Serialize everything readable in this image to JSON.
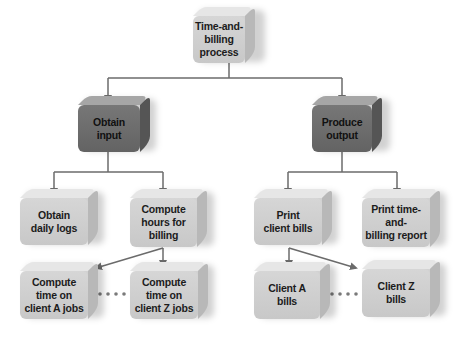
{
  "diagram": {
    "type": "hierarchy chart",
    "root": {
      "label": "Time-and-\nbilling\nprocess"
    },
    "level1": [
      {
        "label": "Obtain\ninput",
        "style": "dark"
      },
      {
        "label": "Produce\noutput",
        "style": "dark"
      }
    ],
    "level2": [
      {
        "label": "Obtain\ndaily logs",
        "parent": "Obtain input"
      },
      {
        "label": "Compute\nhours for\nbilling",
        "parent": "Obtain input"
      },
      {
        "label": "Print\nclient bills",
        "parent": "Produce output"
      },
      {
        "label": "Print time-\nand-\nbilling report",
        "parent": "Produce output"
      }
    ],
    "level3": [
      {
        "label": "Compute\ntime on\nclient A jobs",
        "parent": "Compute hours for billing"
      },
      {
        "label": "Compute\ntime on\nclient Z jobs",
        "parent": "Compute hours for billing"
      },
      {
        "label": "Client A\nbills",
        "parent": "Print client bills"
      },
      {
        "label": "Client Z\nbills",
        "parent": "Print client bills"
      }
    ],
    "colors": {
      "light_box": "#d0d0d0",
      "dark_box": "#6f6f6f",
      "connector": "#6b6b6b"
    }
  }
}
